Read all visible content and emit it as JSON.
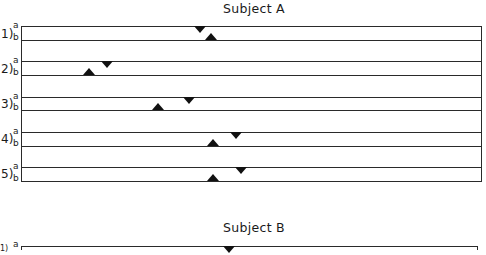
{
  "panels": [
    {
      "title": "Subject A",
      "rows": [
        {
          "label": "1)",
          "a": "a",
          "b": "b",
          "line_a_y": 26,
          "line_b_y": 40,
          "marker_a_x": 200,
          "marker_b_x": 211
        },
        {
          "label": "2)",
          "a": "a",
          "b": "b",
          "line_a_y": 61,
          "line_b_y": 75,
          "marker_a_x": 107,
          "marker_b_x": 89
        },
        {
          "label": "3)",
          "a": "a",
          "b": "b",
          "line_a_y": 97,
          "line_b_y": 110,
          "marker_a_x": 189,
          "marker_b_x": 158
        },
        {
          "label": "4)",
          "a": "a",
          "b": "b",
          "line_a_y": 132,
          "line_b_y": 146,
          "marker_a_x": 236,
          "marker_b_x": 213
        },
        {
          "label": "5)",
          "a": "a",
          "b": "b",
          "line_a_y": 167,
          "line_b_y": 181,
          "marker_a_x": 241,
          "marker_b_x": 213
        }
      ]
    },
    {
      "title": "Subject B",
      "rows": [
        {
          "label": "1)",
          "a": "a",
          "line_a_y": 246,
          "marker_a_x": 229
        }
      ]
    }
  ],
  "legend": {
    "marker_a": "down-triangle on line a",
    "marker_b": "up-triangle on line b"
  }
}
